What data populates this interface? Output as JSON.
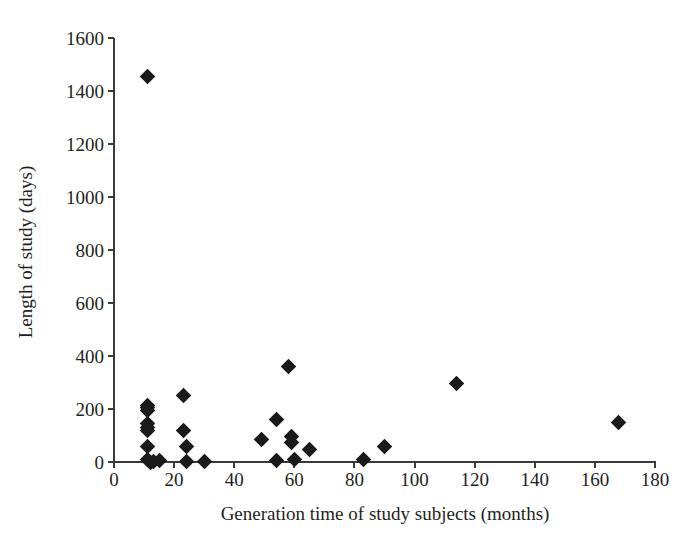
{
  "chart_data": {
    "type": "scatter",
    "title": "",
    "xlabel": "Generation time of study subjects (months)",
    "ylabel": "Length of study (days)",
    "xlim": [
      0,
      180
    ],
    "ylim": [
      0,
      1600
    ],
    "xticks": [
      0,
      20,
      40,
      60,
      80,
      100,
      120,
      140,
      160,
      180
    ],
    "yticks": [
      0,
      200,
      400,
      600,
      800,
      1000,
      1200,
      1400,
      1600
    ],
    "grid": false,
    "legend": null,
    "marker": {
      "shape": "diamond",
      "color": "#1a1a1a",
      "size": 11
    },
    "series": [
      {
        "name": "studies",
        "points": [
          {
            "x": 11,
            "y": 1455
          },
          {
            "x": 11,
            "y": 215
          },
          {
            "x": 11,
            "y": 205
          },
          {
            "x": 11,
            "y": 195
          },
          {
            "x": 11,
            "y": 145
          },
          {
            "x": 11,
            "y": 130
          },
          {
            "x": 11,
            "y": 120
          },
          {
            "x": 11,
            "y": 58
          },
          {
            "x": 11,
            "y": 8
          },
          {
            "x": 12,
            "y": 0
          },
          {
            "x": 13,
            "y": 3
          },
          {
            "x": 15,
            "y": 5
          },
          {
            "x": 23,
            "y": 250
          },
          {
            "x": 23,
            "y": 118
          },
          {
            "x": 24,
            "y": 58
          },
          {
            "x": 24,
            "y": 3
          },
          {
            "x": 30,
            "y": 2
          },
          {
            "x": 49,
            "y": 85
          },
          {
            "x": 54,
            "y": 160
          },
          {
            "x": 54,
            "y": 5
          },
          {
            "x": 58,
            "y": 360
          },
          {
            "x": 59,
            "y": 95
          },
          {
            "x": 59,
            "y": 75
          },
          {
            "x": 60,
            "y": 8
          },
          {
            "x": 65,
            "y": 48
          },
          {
            "x": 83,
            "y": 10
          },
          {
            "x": 90,
            "y": 58
          },
          {
            "x": 114,
            "y": 295
          },
          {
            "x": 168,
            "y": 148
          }
        ]
      }
    ]
  },
  "axis": {
    "x_tick_labels": [
      "0",
      "20",
      "40",
      "60",
      "80",
      "100",
      "120",
      "140",
      "160",
      "180"
    ],
    "y_tick_labels": [
      "0",
      "200",
      "400",
      "600",
      "800",
      "1000",
      "1200",
      "1400",
      "1600"
    ],
    "x_title": "Generation time of study subjects (months)",
    "y_title": "Length of study (days)"
  }
}
